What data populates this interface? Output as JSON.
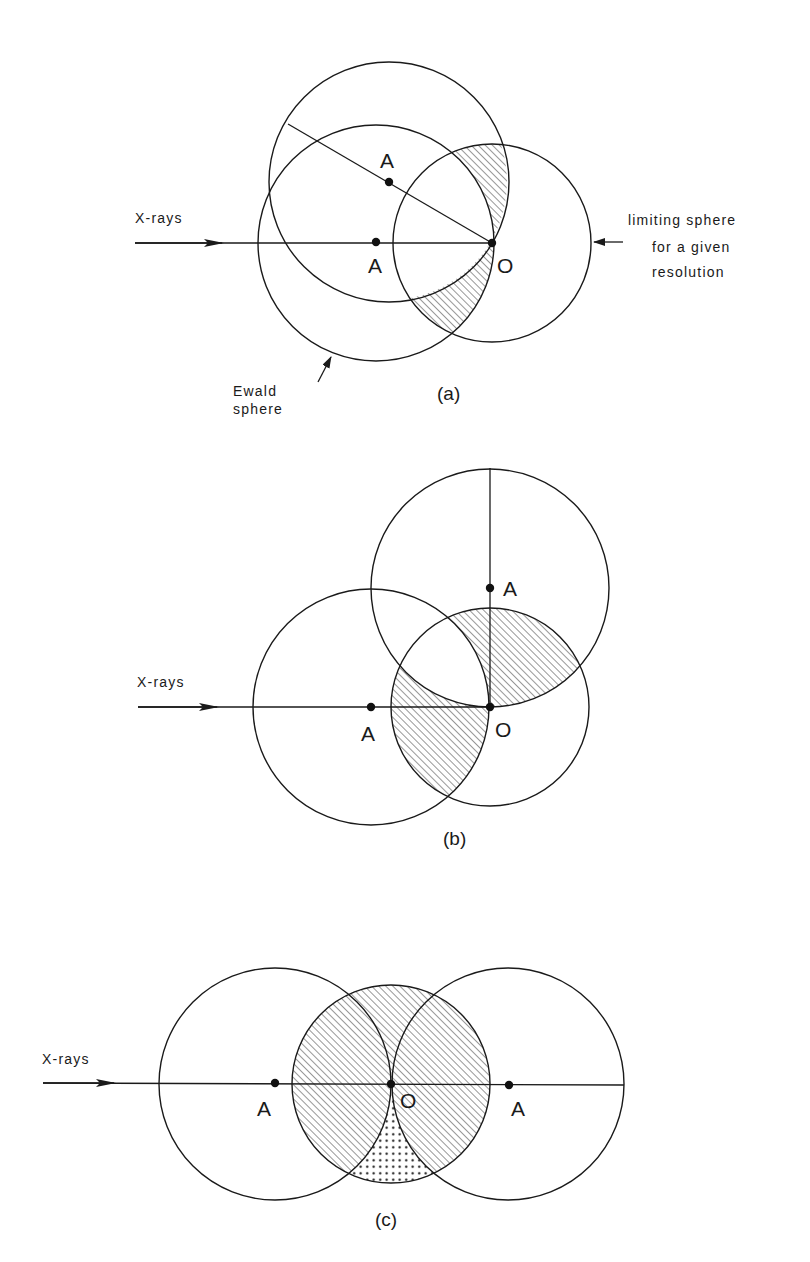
{
  "figure": {
    "colors": {
      "ink": "#1a1a1a",
      "background": "#ffffff"
    },
    "panels": [
      {
        "id": "a",
        "caption": "(a)",
        "beam_label": "X-rays",
        "point_labels": {
          "center_rotated": "A",
          "center": "A",
          "origin": "O"
        },
        "annotations": {
          "ewald_line1": "Ewald",
          "ewald_line2": "sphere",
          "limiting_line1": "limiting sphere",
          "limiting_line2": "for a given",
          "limiting_line3": "resolution"
        },
        "fill_description": "hatched: limiting sphere ∩ (Ewald XOR rotated Ewald)"
      },
      {
        "id": "b",
        "caption": "(b)",
        "beam_label": "X-rays",
        "point_labels": {
          "center_rotated": "A",
          "center": "A",
          "origin": "O"
        },
        "fill_description": "hatched: limiting sphere ∩ (Ewald XOR 90°-rotated Ewald)"
      },
      {
        "id": "c",
        "caption": "(c)",
        "beam_label": "X-rays",
        "point_labels": {
          "center_left": "A",
          "origin": "O",
          "center_right": "A"
        },
        "fill_description": "hatched: limiting sphere; stippled: blind region below O outside both Ewald spheres"
      }
    ]
  }
}
